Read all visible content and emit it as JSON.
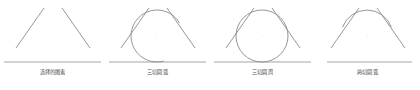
{
  "figure": {
    "background_color": "#ffffff",
    "stroke_color": "#8a8a92",
    "baseline_color": "#9a9aa0",
    "caption_color": "#4a4a4a",
    "width": 420,
    "height": 90
  },
  "panels": [
    {
      "index": 1,
      "caption": "选择的图素",
      "description": "three-selected-lines",
      "has_arc": false,
      "has_circle": false,
      "baseline": {
        "x1": 4,
        "y1": 62,
        "x2": 101,
        "y2": 62
      },
      "lines": [
        {
          "name": "left-tangent-line",
          "x1": 16,
          "y1": 48,
          "x2": 44,
          "y2": 8
        },
        {
          "name": "right-tangent-line",
          "x1": 62,
          "y1": 8,
          "x2": 90,
          "y2": 48
        }
      ]
    },
    {
      "index": 2,
      "caption": "三切圆弧",
      "description": "three-tangent-arc",
      "has_arc": true,
      "has_circle": false,
      "baseline": {
        "x1": 4,
        "y1": 62,
        "x2": 101,
        "y2": 62
      },
      "lines": [
        {
          "name": "left-tangent-line",
          "x1": 16,
          "y1": 48,
          "x2": 44,
          "y2": 8
        },
        {
          "name": "right-tangent-line",
          "x1": 62,
          "y1": 8,
          "x2": 90,
          "y2": 48
        }
      ],
      "arc": {
        "cx": 52,
        "cy": 36,
        "r": 26,
        "start_angle_deg": -30,
        "end_angle_deg": 285,
        "open": true
      }
    },
    {
      "index": 3,
      "caption": "三切圆周",
      "description": "three-tangent-full-circle",
      "has_arc": false,
      "has_circle": true,
      "baseline": {
        "x1": 4,
        "y1": 62,
        "x2": 101,
        "y2": 62
      },
      "lines": [
        {
          "name": "left-tangent-line",
          "x1": 16,
          "y1": 48,
          "x2": 44,
          "y2": 8
        },
        {
          "name": "right-tangent-line",
          "x1": 62,
          "y1": 8,
          "x2": 90,
          "y2": 48
        }
      ],
      "circle": {
        "cx": 52,
        "cy": 36,
        "r": 26
      }
    },
    {
      "index": 4,
      "caption": "两切圆弧",
      "description": "two-tangent-arc",
      "has_arc": true,
      "has_circle": false,
      "baseline": {
        "x1": 12,
        "y1": 62,
        "x2": 97,
        "y2": 62
      },
      "lines": [
        {
          "name": "left-tangent-line",
          "x1": 16,
          "y1": 48,
          "x2": 44,
          "y2": 8
        },
        {
          "name": "right-tangent-line",
          "x1": 62,
          "y1": 8,
          "x2": 90,
          "y2": 48
        }
      ],
      "arc": {
        "cx": 52,
        "cy": 36,
        "r": 26,
        "start_angle_deg": 200,
        "end_angle_deg": 340,
        "open": true
      }
    }
  ]
}
